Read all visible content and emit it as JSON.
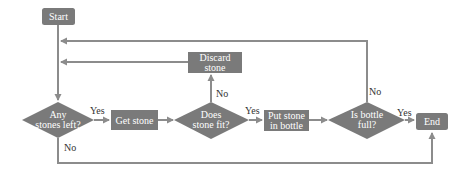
{
  "diagram": {
    "type": "flowchart",
    "colors": {
      "node_fill": "#7a7a7a",
      "edge": "#8c8c8c",
      "node_text": "#ffffff",
      "label_text": "#333333"
    },
    "nodes": {
      "start": {
        "label": "Start",
        "shape": "rounded-rect"
      },
      "discard": {
        "line1": "Discard",
        "line2": "stone",
        "shape": "rect"
      },
      "any_stones": {
        "line1": "Any",
        "line2": "stones left?",
        "shape": "diamond"
      },
      "get_stone": {
        "label": "Get stone",
        "shape": "rect"
      },
      "does_fit": {
        "line1": "Does",
        "line2": "stone fit?",
        "shape": "diamond"
      },
      "put_stone": {
        "line1": "Put stone",
        "line2": "in bottle",
        "shape": "rect"
      },
      "is_full": {
        "line1": "Is bottle",
        "line2": "full?",
        "shape": "diamond"
      },
      "end": {
        "label": "End",
        "shape": "rounded-rect"
      }
    },
    "edge_labels": {
      "any_yes": "Yes",
      "any_no": "No",
      "fit_yes": "Yes",
      "fit_no": "No",
      "full_yes": "Yes",
      "full_no": "No"
    }
  }
}
